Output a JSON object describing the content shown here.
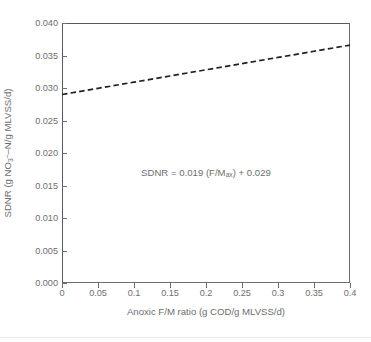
{
  "chart_data": {
    "type": "line",
    "title": "",
    "subtitle": "",
    "xlabel_plain": "Anoxic F/M ratio (g COD/g MLVSS/d)",
    "ylabel_plain": "SDNR (g NO3--N/g MLVSS/d)",
    "xlim": [
      0,
      0.4
    ],
    "ylim": [
      0,
      0.04
    ],
    "xticks": [
      0,
      0.05,
      0.1,
      0.15,
      0.2,
      0.25,
      0.3,
      0.35,
      0.4
    ],
    "xtick_labels": [
      "0",
      "0.05",
      "0.1",
      "0.15",
      "0.2",
      "0.25",
      "0.3",
      "0.35",
      "0.4"
    ],
    "yticks": [
      0,
      0.005,
      0.01,
      0.015,
      0.02,
      0.025,
      0.03,
      0.035,
      0.04
    ],
    "ytick_labels": [
      "0.000",
      "0.005",
      "0.010",
      "0.015",
      "0.020",
      "0.025",
      "0.030",
      "0.035",
      "0.040"
    ],
    "grid": false,
    "legend": null,
    "legend_position": "none",
    "series": [
      {
        "name": "SDNR regression",
        "style": "dashed",
        "color": "#231f20",
        "x": [
          0,
          0.05,
          0.1,
          0.15,
          0.2,
          0.25,
          0.3,
          0.35,
          0.4
        ],
        "values": [
          0.029,
          0.02995,
          0.0309,
          0.03185,
          0.0328,
          0.03375,
          0.0347,
          0.03565,
          0.0366
        ]
      }
    ],
    "annotations": [
      {
        "text_plain": "SDNR = 0.019 (F/Max) + 0.029",
        "x": 0.2,
        "y": 0.0178,
        "slope": 0.019,
        "intercept": 0.029
      }
    ]
  },
  "axes": {
    "ylabel": {
      "prefix": "SDNR (g NO",
      "sub": "3",
      "sup": "–",
      "middle": "–N/g MLVSS/d)"
    },
    "xlabel": "Anoxic F/M ratio (g COD/g MLVSS/d)"
  },
  "annotation": {
    "part1": "SDNR = 0.019 (F/M",
    "sub": "ax",
    "part2": ") + 0.029"
  },
  "colors": {
    "line": "#231f20",
    "axis": "#6d6e70",
    "axis_dark": "#58595b",
    "text": "#6d6e70",
    "background": "#ffffff",
    "divider": "#e8eaec"
  }
}
